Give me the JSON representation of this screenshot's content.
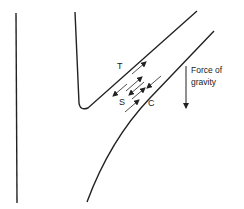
{
  "diagram": {
    "labels": {
      "tension": "T",
      "shear": "S",
      "compression": "C",
      "gravity_line1": "Force of",
      "gravity_line2": "gravity"
    },
    "icons": {
      "gravity_arrow": "arrow-down-icon",
      "force_arrows": "double-headed-arrow-pairs"
    },
    "colors": {
      "stroke": "#222222",
      "background": "#ffffff"
    }
  }
}
